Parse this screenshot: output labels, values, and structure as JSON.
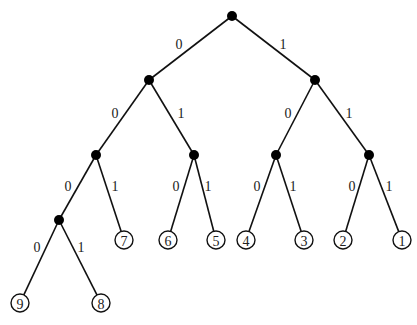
{
  "diagram": {
    "type": "binary-tree",
    "internal_nodes": [
      {
        "id": "r",
        "x": 232,
        "y": 16
      },
      {
        "id": "n0",
        "x": 149,
        "y": 80
      },
      {
        "id": "n1",
        "x": 315,
        "y": 80
      },
      {
        "id": "n00",
        "x": 96,
        "y": 155
      },
      {
        "id": "n01",
        "x": 194,
        "y": 155
      },
      {
        "id": "n10",
        "x": 276,
        "y": 155
      },
      {
        "id": "n11",
        "x": 369,
        "y": 155
      },
      {
        "id": "n000",
        "x": 59,
        "y": 220
      }
    ],
    "leaves": [
      {
        "id": "l9",
        "label": "9",
        "x": 20,
        "y": 303
      },
      {
        "id": "l8",
        "label": "8",
        "x": 101,
        "y": 303
      },
      {
        "id": "l7",
        "label": "7",
        "x": 124,
        "y": 240
      },
      {
        "id": "l6",
        "label": "6",
        "x": 168,
        "y": 240
      },
      {
        "id": "l5",
        "label": "5",
        "x": 216,
        "y": 240
      },
      {
        "id": "l4",
        "label": "4",
        "x": 246,
        "y": 240
      },
      {
        "id": "l3",
        "label": "3",
        "x": 304,
        "y": 240
      },
      {
        "id": "l2",
        "label": "2",
        "x": 343,
        "y": 240
      },
      {
        "id": "l1",
        "label": "1",
        "x": 402,
        "y": 240
      }
    ],
    "edges": [
      {
        "from": "r",
        "to": "n0",
        "label": "0",
        "lx": 179,
        "ly": 44
      },
      {
        "from": "r",
        "to": "n1",
        "label": "1",
        "lx": 283,
        "ly": 44
      },
      {
        "from": "n0",
        "to": "n00",
        "label": "0",
        "lx": 115,
        "ly": 113
      },
      {
        "from": "n0",
        "to": "n01",
        "label": "1",
        "lx": 181,
        "ly": 113
      },
      {
        "from": "n1",
        "to": "n10",
        "label": "0",
        "lx": 288,
        "ly": 113
      },
      {
        "from": "n1",
        "to": "n11",
        "label": "1",
        "lx": 349,
        "ly": 113
      },
      {
        "from": "n00",
        "to": "n000",
        "label": "0",
        "lx": 68,
        "ly": 186
      },
      {
        "from": "n00",
        "to": "l7",
        "label": "1",
        "lx": 115,
        "ly": 186
      },
      {
        "from": "n01",
        "to": "l6",
        "label": "0",
        "lx": 176,
        "ly": 186
      },
      {
        "from": "n01",
        "to": "l5",
        "label": "1",
        "lx": 208,
        "ly": 186
      },
      {
        "from": "n10",
        "to": "l4",
        "label": "0",
        "lx": 257,
        "ly": 186
      },
      {
        "from": "n10",
        "to": "l3",
        "label": "1",
        "lx": 293,
        "ly": 186
      },
      {
        "from": "n11",
        "to": "l2",
        "label": "0",
        "lx": 352,
        "ly": 186
      },
      {
        "from": "n11",
        "to": "l1",
        "label": "1",
        "lx": 389,
        "ly": 186
      },
      {
        "from": "n000",
        "to": "l9",
        "label": "0",
        "lx": 37,
        "ly": 247
      },
      {
        "from": "n000",
        "to": "l8",
        "label": "1",
        "lx": 81,
        "ly": 247
      }
    ]
  }
}
